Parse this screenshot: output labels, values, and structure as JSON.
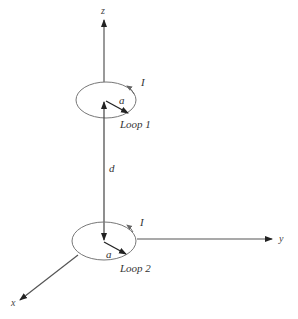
{
  "diagram": {
    "type": "physics-schematic",
    "axes": {
      "x": {
        "label": "x"
      },
      "y": {
        "label": "y"
      },
      "z": {
        "label": "z"
      }
    },
    "loop1": {
      "name": "Loop 1",
      "current_label": "I",
      "radius_label": "a"
    },
    "loop2": {
      "name": "Loop 2",
      "current_label": "I",
      "radius_label": "a"
    },
    "separation_label": "d"
  },
  "colors": {
    "line": "#555555",
    "loop": "#777777",
    "arrow": "#222222"
  }
}
